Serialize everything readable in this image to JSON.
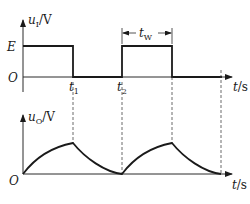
{
  "diagram": {
    "type": "waveform-timing-diagram",
    "top_plot": {
      "y_axis_label_main": "u",
      "y_axis_label_sub": "I",
      "y_axis_unit": "/V",
      "level_high_label": "E",
      "origin_label": "O",
      "x_axis_label_main": "t",
      "x_axis_unit": "/s",
      "time_markers": [
        {
          "main": "t",
          "sub": "1"
        },
        {
          "main": "t",
          "sub": "2"
        }
      ],
      "pulse_width_label_main": "t",
      "pulse_width_label_sub": "W"
    },
    "bottom_plot": {
      "y_axis_label_main": "u",
      "y_axis_label_sub": "O",
      "y_axis_unit": "/V",
      "origin_label": "O",
      "x_axis_label_main": "t",
      "x_axis_unit": "/s"
    },
    "colors": {
      "line": "#1a1a1a",
      "background": "#ffffff"
    }
  }
}
